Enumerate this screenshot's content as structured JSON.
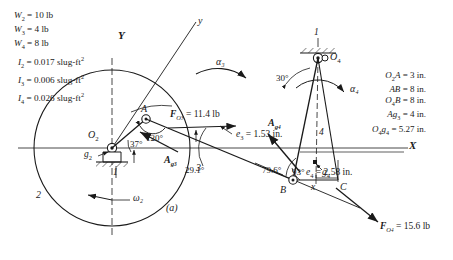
{
  "figure": {
    "caption": "(a)",
    "axis_labels": {
      "Y": "Y",
      "X": "X",
      "y": "y",
      "x": "x"
    },
    "properties": [
      {
        "sym": "W",
        "sub": "2",
        "value": "10 lb"
      },
      {
        "sym": "W",
        "sub": "3",
        "value": "4 lb"
      },
      {
        "sym": "W",
        "sub": "4",
        "value": "8 lb"
      },
      {
        "sym": "I",
        "sub": "2",
        "value": "0.017 slug-ft",
        "sup": "2"
      },
      {
        "sym": "I",
        "sub": "3",
        "value": "0.006 slug-ft",
        "sup": "2"
      },
      {
        "sym": "I",
        "sub": "4",
        "value": "0.026 slug-ft",
        "sup": "2"
      }
    ],
    "dimensions": [
      {
        "label": "O₂A",
        "value": "3 in."
      },
      {
        "label": "AB",
        "value": "8 in."
      },
      {
        "label": "O₄B",
        "value": "8 in."
      },
      {
        "label": "Ag₃",
        "value": "4 in."
      },
      {
        "label": "O₄g₄",
        "value": "5.27 in."
      }
    ],
    "points": {
      "O2": "O₂",
      "O4": "O₄",
      "A": "A",
      "B": "B",
      "C": "C",
      "g2": "g₂",
      "g4": "g₄"
    },
    "link_numbers": {
      "ground_left": "1",
      "link2": "2",
      "link3": "3",
      "ground_right": "1",
      "link4": "4"
    },
    "angles": {
      "theta37": "37°",
      "theta120": "120°",
      "theta29": "29.1°",
      "theta30": "30°",
      "theta79": "79.6°",
      "theta93": "93°"
    },
    "kinematics": {
      "omega2": "ω₂",
      "alpha3": "α₃",
      "alpha4": "α₄"
    },
    "vectors": {
      "Ag3": "A",
      "Ag3_sub": "g₃",
      "Ag4": "A",
      "Ag4_sub": "g₄"
    },
    "forces": [
      {
        "name": "F_O3",
        "label": "F",
        "sub": "O₃",
        "value": "= 11.4 lb"
      },
      {
        "name": "F_O4",
        "label": "F",
        "sub": "O₄",
        "value": "= 15.6 lb"
      }
    ],
    "offsets": [
      {
        "name": "e3",
        "label": "e",
        "sub": "3",
        "value": "= 1.53 in."
      },
      {
        "name": "e4",
        "label": "e",
        "sub": "4",
        "value": "= 2.58 in."
      }
    ],
    "colors": {
      "ink": "#1a1a1a",
      "paper": "#ffffff"
    }
  }
}
